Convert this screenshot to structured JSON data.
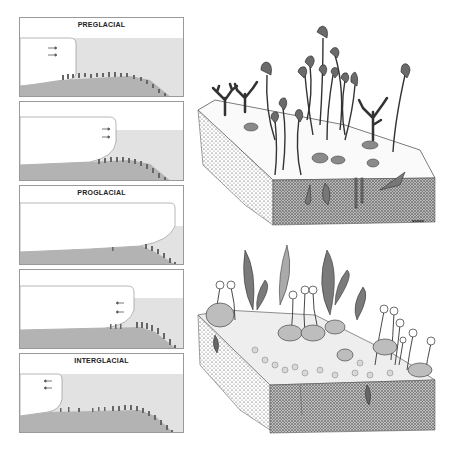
{
  "figure": {
    "panels": [
      {
        "id": "p1",
        "title": "PREGLACIAL",
        "arrows": "right",
        "top": 17
      },
      {
        "id": "p2",
        "title": "",
        "arrows": "right",
        "top": 101
      },
      {
        "id": "p3",
        "title": "PROGLACIAL",
        "arrows": "none",
        "top": 185
      },
      {
        "id": "p4",
        "title": "",
        "arrows": "left",
        "top": 269
      },
      {
        "id": "p5",
        "title": "INTERGLACIAL",
        "arrows": "left",
        "top": 353
      }
    ],
    "colors": {
      "ice": "#ffffff",
      "water": "#e2e2e2",
      "seabed": "#b3b3b3",
      "border": "#9a9a9a",
      "ink": "#222222"
    },
    "scenes": [
      {
        "id": "upper",
        "description": "Ediacaran-style sea floor block with stalked frond organisms and branching forms"
      },
      {
        "id": "lower",
        "description": "Sea floor block with feather-like fronds, stalked spheres and dense benthic community"
      }
    ],
    "signature": "ʙᴏᴘᴋᴀ"
  }
}
